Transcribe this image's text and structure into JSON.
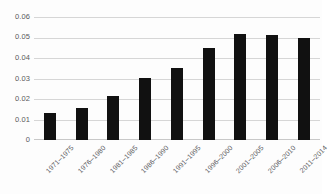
{
  "chart_data": {
    "type": "bar",
    "title": "",
    "subtitle": "",
    "xlabel": "",
    "ylabel": "",
    "categories": [
      "1971–1975",
      "1976–1980",
      "1981–1985",
      "1986–1990",
      "1991–1995",
      "1996–2000",
      "2001–2005",
      "2006–2010",
      "2011–2014"
    ],
    "values": [
      0.0133,
      0.0155,
      0.0218,
      0.0307,
      0.0353,
      0.0452,
      0.0522,
      0.0518,
      0.0502
    ],
    "ylim": [
      0,
      0.06
    ],
    "yticks": [
      0,
      0.01,
      0.02,
      0.03,
      0.04,
      0.05,
      0.06
    ],
    "ytick_labels": [
      "0",
      "0.01",
      "0.02",
      "0.03",
      "0.04",
      "0.05",
      "0.06"
    ],
    "grid": true,
    "legend": false,
    "legend_position": "none",
    "bar_color": "#111111",
    "grid_color": "#d6d6d6",
    "axis_text_color": "#59595b",
    "background_color": "#fdfdfd"
  }
}
